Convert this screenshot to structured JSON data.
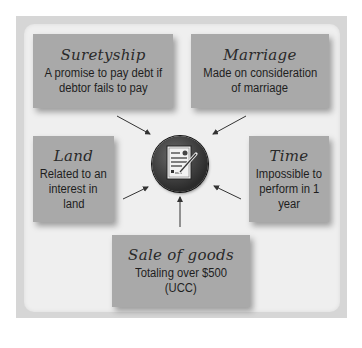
{
  "diagram": {
    "center": {
      "icon": "signed-contract-icon"
    },
    "boxes": [
      {
        "id": "suretyship",
        "title": "Suretyship",
        "desc_lines": [
          "A promise to pay debt if",
          "debtor fails to pay"
        ]
      },
      {
        "id": "marriage",
        "title": "Marriage",
        "desc_lines": [
          "Made on consideration",
          "of marriage"
        ]
      },
      {
        "id": "land",
        "title": "Land",
        "desc_lines": [
          "Related to an",
          "interest in",
          "land"
        ]
      },
      {
        "id": "time",
        "title": "Time",
        "desc_lines": [
          "Impossible to",
          "perform in 1",
          "year"
        ]
      },
      {
        "id": "sale-of-goods",
        "title": "Sale of goods",
        "desc_lines": [
          "Totaling over $500",
          "(UCC)"
        ]
      }
    ],
    "colors": {
      "frame": "#d6d6d6",
      "panel": "#efefef",
      "box": "#a9a9a9",
      "hub": "#3a3a3a",
      "arrow": "#333333"
    }
  }
}
